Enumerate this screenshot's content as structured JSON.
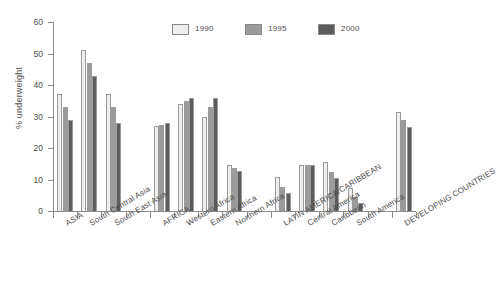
{
  "chart_data": {
    "type": "bar",
    "title": "",
    "subtitle": "",
    "xlabel": "",
    "ylabel": "% underweight",
    "ylim": [
      0,
      60
    ],
    "ytick_values": [
      0,
      10,
      20,
      30,
      40,
      50,
      60
    ],
    "ytick_labels": [
      "0",
      "10",
      "20",
      "30",
      "40",
      "50",
      "60"
    ],
    "grid": false,
    "legend_position": "top-center",
    "categories": [
      "ASIA",
      "South Central Asia",
      "South East Asia",
      "AFRICA",
      "Western Africa",
      "Eastern Africa",
      "Northern Africa",
      "LATIN AMERICA/CARIBBEAN",
      "Central America",
      "Caribbean",
      "South America",
      "DEVELOPING COUNTRIES"
    ],
    "series": [
      {
        "name": "1990",
        "color": "#eeeeee",
        "values": [
          37,
          51,
          37,
          27,
          34,
          30,
          14.5,
          10.7,
          14.6,
          15.6,
          7.4,
          31.5
        ]
      },
      {
        "name": "1995",
        "color": "#9b9b9b",
        "values": [
          33,
          47,
          33,
          27.4,
          35,
          33,
          13.6,
          7.7,
          14.6,
          12.4,
          4.5,
          29
        ]
      },
      {
        "name": "2000",
        "color": "#5c5c5c",
        "values": [
          29,
          43,
          28,
          28,
          35.8,
          35.8,
          12.7,
          5.6,
          14.5,
          10.5,
          2.5,
          26.6
        ]
      }
    ]
  },
  "legend": {
    "items": [
      {
        "label": "1990",
        "color": "#eeeeee"
      },
      {
        "label": "1995",
        "color": "#9b9b9b"
      },
      {
        "label": "2000",
        "color": "#5c5c5c"
      }
    ]
  },
  "axis": {
    "y_title": "% underweight"
  }
}
